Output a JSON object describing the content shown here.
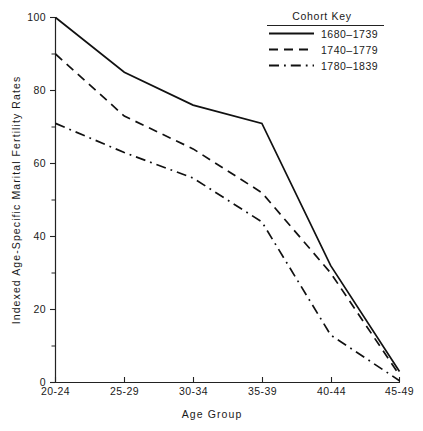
{
  "chart_data": {
    "type": "line",
    "title": "",
    "xlabel": "Age Group",
    "ylabel": "Indexed Age-Specific Marital Fertility Rates",
    "categories": [
      "20-24",
      "25-29",
      "30-34",
      "35-39",
      "40-44",
      "45-49"
    ],
    "ylim": [
      0,
      100
    ],
    "yticks": [
      0,
      20,
      40,
      60,
      80,
      100
    ],
    "ytick_labels": [
      "0",
      "20",
      "40",
      "60",
      "80",
      "100"
    ],
    "yminor_ticks": [
      10,
      30,
      50,
      70,
      90
    ],
    "grid": false,
    "legend_position": "top-right",
    "legend_title": "Cohort  Key",
    "series": [
      {
        "name": "1680-1739",
        "style": "solid",
        "values": [
          100,
          85,
          76,
          71,
          32,
          3
        ]
      },
      {
        "name": "1740-1779",
        "style": "dashed",
        "values": [
          90,
          73,
          64,
          52,
          30,
          2
        ]
      },
      {
        "name": "1780-1839",
        "style": "dash-dot",
        "values": [
          71,
          63,
          56,
          44,
          13,
          0.5
        ]
      }
    ]
  },
  "axes": {
    "y_title": "Indexed Age-Specific Marital Fertility Rates",
    "x_title": "Age  Group",
    "y_labels": {
      "t100": "100",
      "t80": "80",
      "t60": "60",
      "t40": "40",
      "t20": "20",
      "t0": "0"
    },
    "x_labels": {
      "c0": "20-24",
      "c1": "25-29",
      "c2": "30-34",
      "c3": "35-39",
      "c4": "40-44",
      "c5": "45-49"
    }
  },
  "legend": {
    "title": "Cohort  Key",
    "items": {
      "i0": "1680–1739",
      "i1": "1740–1779",
      "i2": "1780–1839"
    }
  },
  "colors": {
    "ink": "#111111",
    "axis": "#222222",
    "background": "#ffffff"
  }
}
